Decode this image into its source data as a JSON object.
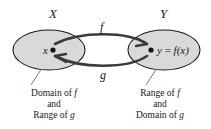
{
  "figure": {
    "type": "set-mapping-diagram",
    "background_color": "#ffffff",
    "ellipse_fill": "#d9d9d9",
    "ellipse_stroke": "#1a1a1a",
    "arrow_color": "#3a3a3a",
    "text_color": "#1a1a1a"
  },
  "sets": {
    "left": {
      "name": "X",
      "element_label": "x",
      "caption_line1": "Domain of ",
      "caption_line1_italic": "f",
      "caption_line2": "and",
      "caption_line3": "Range of ",
      "caption_line3_italic": "g"
    },
    "right": {
      "name": "Y",
      "element_label_y": "y",
      "element_label_eq": " = ",
      "element_label_fx_f": "f",
      "element_label_fx_arg": "(x)",
      "caption_line1": "Range of ",
      "caption_line1_italic": "f",
      "caption_line2": "and",
      "caption_line3": "Domain of ",
      "caption_line3_italic": "g"
    }
  },
  "mappings": {
    "forward": {
      "label": "f",
      "direction": "left-to-right",
      "description": "arrow from x in X to y in Y"
    },
    "backward": {
      "label": "g",
      "direction": "right-to-left",
      "description": "arrow from y in Y to x in X"
    }
  }
}
